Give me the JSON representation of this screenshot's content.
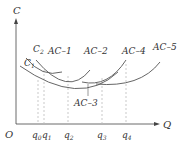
{
  "diagram": {
    "title": "",
    "axes": {
      "y_label": "C",
      "x_label": "Q",
      "origin_label": "O"
    },
    "y_markers": [
      {
        "id": "C2",
        "base": "C",
        "sub": "2"
      },
      {
        "id": "C1",
        "base": "C",
        "sub": "1"
      }
    ],
    "x_ticks": [
      {
        "id": "q0",
        "base": "q",
        "sub": "0"
      },
      {
        "id": "q1",
        "base": "q",
        "sub": "1"
      },
      {
        "id": "q2",
        "base": "q",
        "sub": "2"
      },
      {
        "id": "q3",
        "base": "q",
        "sub": "3"
      },
      {
        "id": "q4",
        "base": "q",
        "sub": "4"
      }
    ],
    "curves": [
      {
        "id": "AC-1",
        "label": "AC–1"
      },
      {
        "id": "AC-2",
        "label": "AC–2"
      },
      {
        "id": "AC-3",
        "label": "AC–3"
      },
      {
        "id": "AC-4",
        "label": "AC–4"
      },
      {
        "id": "AC-5",
        "label": "AC–5"
      }
    ],
    "colors": {
      "axis": "#444444",
      "curve": "#555555",
      "guide": "#bbbbbb",
      "text": "#333333"
    }
  }
}
